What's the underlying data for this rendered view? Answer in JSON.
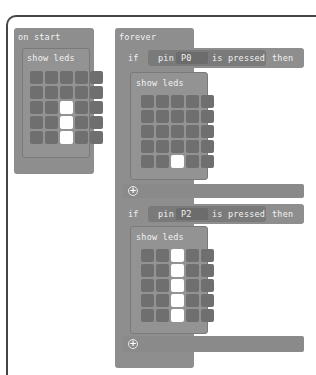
{
  "on_start": {
    "label": "on start",
    "show_leds": {
      "label": "show leds",
      "grid": [
        [
          0,
          0,
          0,
          0,
          0
        ],
        [
          0,
          0,
          0,
          0,
          0
        ],
        [
          0,
          0,
          1,
          0,
          0
        ],
        [
          0,
          0,
          1,
          0,
          0
        ],
        [
          0,
          0,
          1,
          0,
          0
        ]
      ]
    }
  },
  "forever": {
    "label": "forever",
    "if_blocks": [
      {
        "if_label": "if",
        "pin_label": "pin",
        "pin_value": "P0",
        "condition_label": "is pressed",
        "then_label": "then",
        "show_leds": {
          "label": "show leds",
          "grid": [
            [
              0,
              0,
              0,
              0,
              0
            ],
            [
              0,
              0,
              0,
              0,
              0
            ],
            [
              0,
              0,
              0,
              0,
              0
            ],
            [
              0,
              0,
              0,
              0,
              0
            ],
            [
              0,
              0,
              1,
              0,
              0
            ]
          ]
        },
        "add_icon": "plus-circle-icon"
      },
      {
        "if_label": "if",
        "pin_label": "pin",
        "pin_value": "P2",
        "condition_label": "is pressed",
        "then_label": "then",
        "show_leds": {
          "label": "show leds",
          "grid": [
            [
              0,
              0,
              1,
              0,
              0
            ],
            [
              0,
              0,
              1,
              0,
              0
            ],
            [
              0,
              0,
              1,
              0,
              0
            ],
            [
              0,
              0,
              1,
              0,
              0
            ],
            [
              0,
              0,
              1,
              0,
              0
            ]
          ]
        },
        "add_icon": "plus-circle-icon"
      }
    ]
  },
  "colors": {
    "block": "#8e8e8e",
    "led_off": "#6f6f6f",
    "led_on": "#ffffff"
  }
}
